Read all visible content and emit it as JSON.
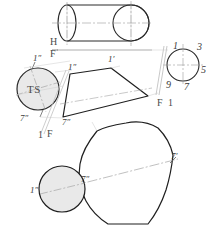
{
  "drawing": {
    "title": "Truncated Cylinder Development Drawing",
    "colors": {
      "object_line": "#1a1a1a",
      "construction_line": "#b8b8b8",
      "center_line": "#9a9a9a",
      "fold_line": "#cfcfcf",
      "circle_fill": "#e9e9e9",
      "text": "#3a3a3a",
      "background": "#ffffff"
    },
    "views": {
      "front_elevation": {
        "name": "front-elevation-cylinder",
        "fold_label_top": "H",
        "fold_label_bottom": "F"
      },
      "edge_view_circle": {
        "name": "edge-view-circle",
        "points": [
          "1",
          "3",
          "5",
          "7",
          "9"
        ],
        "fold_label_left": "F",
        "fold_label_right": "1"
      },
      "true_size_circle": {
        "name": "true-size-auxiliary-circle",
        "ts_label": "TS",
        "point_top": "1″",
        "point_bottom": "7″",
        "fold_label_left": "1",
        "fold_label_right": "F"
      },
      "auxiliary_trapezoid": {
        "name": "auxiliary-trapezoid-view",
        "apex_label": "1′",
        "upper_left_label": "1″",
        "lower_left_label": "7″"
      },
      "development_pattern": {
        "name": "development-stretchout-pattern",
        "right_label": "7′",
        "tangent_point_label": "7″",
        "left_circle_label": "1″"
      }
    }
  }
}
